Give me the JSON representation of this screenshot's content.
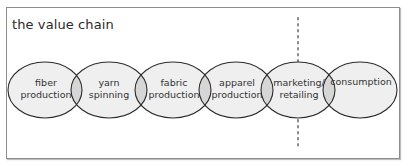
{
  "title": "the value chain",
  "stages": [
    {
      "line1": "fiber",
      "line2": "production",
      "cx": 45
    },
    {
      "line1": "yarn",
      "line2": "spinning",
      "cx": 109
    },
    {
      "line1": "fabric",
      "line2": "production",
      "cx": 173
    },
    {
      "line1": "apparel",
      "line2": "production",
      "cx": 236
    },
    {
      "line1": "marketing/",
      "line2": "retailing",
      "cx": 298
    },
    {
      "line1": "consumption",
      "line2": "",
      "cx": 360
    }
  ],
  "colors": {
    "ellipse_fill": "#efefef",
    "overlap_fill": "#d6d6d6",
    "ellipse_stroke": "#2b2b2b",
    "divider": "#8a8a8a",
    "frame_border": "#8c8c8c"
  }
}
